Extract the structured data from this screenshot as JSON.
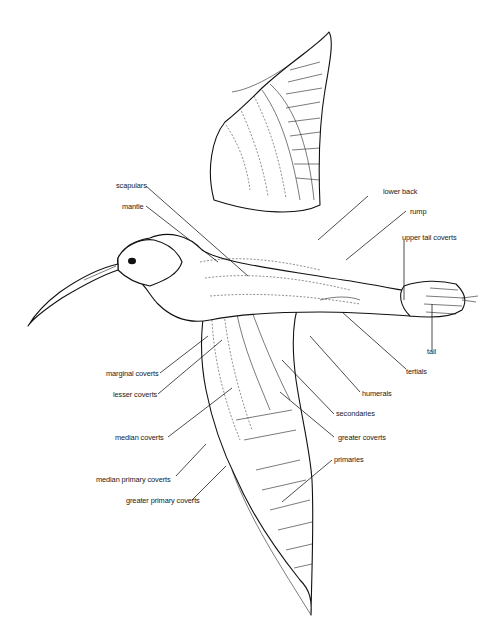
{
  "figure": {
    "caption_partial": "Fig. — feather tracts of the upperparts"
  },
  "labels": {
    "scapulars": "scapulars",
    "mantle": "mantle",
    "lower_back": "lower back",
    "rump": "rump",
    "upper_tail_coverts": "upper tail coverts",
    "tail": "tail",
    "tertials": "tertials",
    "humerals": "humerals",
    "secondaries": "secondaries",
    "greater_coverts": "greater coverts",
    "primaries": "primaries",
    "marginal_coverts": "marginal coverts",
    "lesser_coverts": "lesser coverts",
    "median_coverts": "median coverts",
    "median_primary_coverts": "median primary coverts",
    "greater_primary_coverts": "greater primary coverts"
  },
  "colors": {
    "ink": "#111111",
    "background": "#ffffff"
  }
}
